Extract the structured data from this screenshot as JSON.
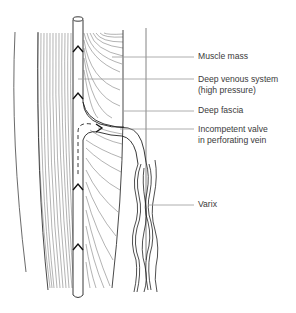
{
  "diagram": {
    "labels": [
      {
        "id": "muscle-mass",
        "text": "Muscle mass"
      },
      {
        "id": "deep-venous-system",
        "line1": "Deep venous system",
        "line2": "(high pressure)"
      },
      {
        "id": "deep-fascia",
        "text": "Deep fascia"
      },
      {
        "id": "incompetent-valve",
        "line1": "Incompetent valve",
        "line2": "in perforating vein"
      },
      {
        "id": "varix",
        "text": "Varix"
      }
    ],
    "colors": {
      "ink": "#2a2a2a",
      "leader": "#9a9a9a",
      "background": "#ffffff"
    }
  }
}
